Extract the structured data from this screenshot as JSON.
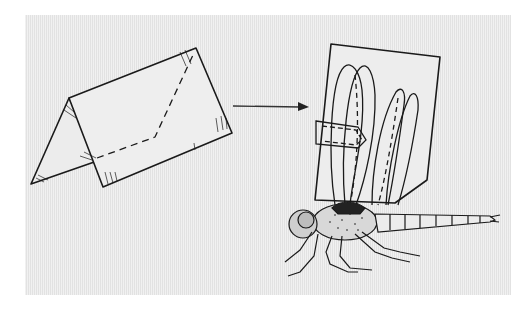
{
  "figure": {
    "description": "Folded paper tent transforms into a rectangular card attached to the wings of a dragonfly",
    "background_color": "#e9e9e9",
    "line_color": "#1a1a1a",
    "elements": [
      {
        "id": "folded-tent",
        "label": "Folded paper (tent fold) with dashed cut line"
      },
      {
        "id": "arrow",
        "label": "Arrow pointing right"
      },
      {
        "id": "card",
        "label": "Rectangular card clipped over dragonfly wings"
      },
      {
        "id": "dragonfly",
        "label": "Dragonfly with wings held together"
      }
    ]
  }
}
